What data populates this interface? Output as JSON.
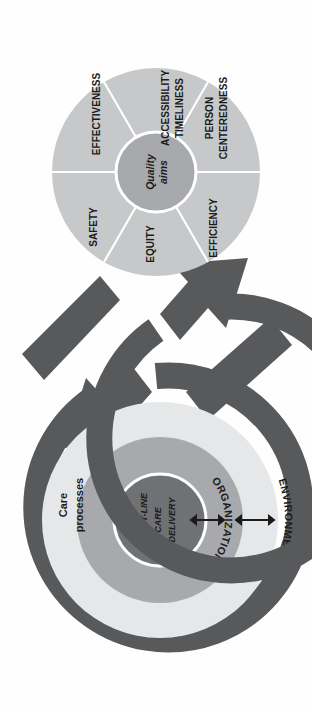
{
  "figure": {
    "name": "healthcare-quality-framework-diagram",
    "orientation": "rotated-90-clockwise",
    "colors": {
      "dark_ring": "#58595b",
      "mid_gray": "#a7a9ac",
      "light_wedge": "#c7c8ca",
      "pale_ring": "#e6e7e8",
      "white": "#ffffff",
      "text": "#1b1b1b",
      "background": "#fefefe"
    }
  },
  "quality_aims_wheel": {
    "name": "quality-aims-wheel",
    "hub_label_line1": "Quality",
    "hub_label_line2": "aims",
    "hub_label_full": "Quality aims",
    "spokes": [
      {
        "id": "accessibility-timeliness",
        "line1": "ACCESSIBILITY",
        "line2": "TIMELINESS"
      },
      {
        "id": "person-centeredness",
        "line1": "PERSON",
        "line2": "CENTEREDNESS"
      },
      {
        "id": "efficiency",
        "line1": "EFFICIENCY",
        "line2": ""
      },
      {
        "id": "equity",
        "line1": "EQUITY",
        "line2": ""
      },
      {
        "id": "safety",
        "line1": "SAFETY",
        "line2": ""
      },
      {
        "id": "effectiveness",
        "line1": "EFFECTIVENESS",
        "line2": ""
      }
    ]
  },
  "systems_wheel": {
    "name": "system-levels-wheel",
    "core_label_line1": "FRONT-LINE",
    "core_label_line2": "CARE",
    "core_label_line3": "DELIVERY",
    "core_label_full": "FRONT-LINE CARE DELIVERY",
    "ring_mid_label": "ORGANIZATION",
    "ring_outer_label": "ENVIRONMENT",
    "band_label_line1": "Care",
    "band_label_line2": "processes",
    "band_label_full": "Care processes"
  },
  "connectors": {
    "arrow_top_name": "spiral-arrow-top",
    "arrow_bottom_name": "spiral-arrow-bottom",
    "double_arrow_inner_name": "bidirectional-arrow-core-to-organization",
    "double_arrow_outer_name": "bidirectional-arrow-organization-to-environment"
  }
}
